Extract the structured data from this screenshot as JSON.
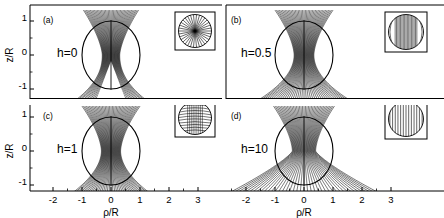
{
  "figure": {
    "background_color": "#ffffff",
    "line_color": "#000000",
    "width": 444,
    "height": 218
  },
  "axes": {
    "x_title": "ρ/R",
    "y_title": "z/R",
    "x_ticks_left": [
      "-2",
      "-1",
      "0",
      "1",
      "2",
      "3"
    ],
    "x_ticks_right": [
      "-3",
      "-2",
      "-1",
      "0",
      "1",
      "2",
      "3"
    ],
    "y_ticks": [
      "1",
      "0",
      "-1"
    ],
    "x_range": [
      -3,
      3
    ],
    "y_range": [
      -1.35,
      1.35
    ]
  },
  "panels": [
    {
      "tag": "(a)",
      "h_label": "h=0",
      "h_value": 0,
      "inset_pattern": "radial-spokes",
      "position": "top-left"
    },
    {
      "tag": "(b)",
      "h_label": "h=0.5",
      "h_value": 0.5,
      "inset_pattern": "mixed-radial-vertical",
      "position": "top-right"
    },
    {
      "tag": "(c)",
      "h_label": "h=1",
      "h_value": 1,
      "inset_pattern": "curved-arcs",
      "position": "bottom-left"
    },
    {
      "tag": "(d)",
      "h_label": "h=10",
      "h_value": 10,
      "inset_pattern": "near-uniform-vertical",
      "position": "bottom-right"
    }
  ],
  "chart_data": {
    "type": "line",
    "title": "",
    "xlabel": "ρ/R",
    "ylabel": "z/R",
    "xlim": [
      -3,
      3
    ],
    "ylim": [
      -1.35,
      1.35
    ],
    "grid": false,
    "legend": "none",
    "series": [
      {
        "name": "h=0",
        "panel": "(a)",
        "n_streamlines": 41,
        "far_field_half_width": 1.25,
        "interior": "purely radial spokes from centre",
        "notes": "field lines crowd into a narrow vertical column; a white triangular void opens below the sphere centre"
      },
      {
        "name": "h=0.5",
        "panel": "(b)",
        "n_streamlines": 41,
        "far_field_half_width": 1.6,
        "interior": "radial spokes near centre merging to vertical lines",
        "notes": "streamlines flare moderately outside the sphere"
      },
      {
        "name": "h=1",
        "panel": "(c)",
        "n_streamlines": 41,
        "far_field_half_width": 1.5,
        "interior": "curved arcs",
        "notes": "bell-shaped envelope reaching ρ/R ≈ ±1.5 at z/R = -1.35"
      },
      {
        "name": "h=10",
        "panel": "(d)",
        "n_streamlines": 41,
        "far_field_half_width": 2.8,
        "interior": "near-uniform vertical lines",
        "notes": "streamlines splay widely, reaching ρ/R ≈ ±2.8 at the bottom of the frame"
      }
    ],
    "sphere": {
      "radius": 1.0,
      "center": [
        0,
        0
      ]
    }
  }
}
